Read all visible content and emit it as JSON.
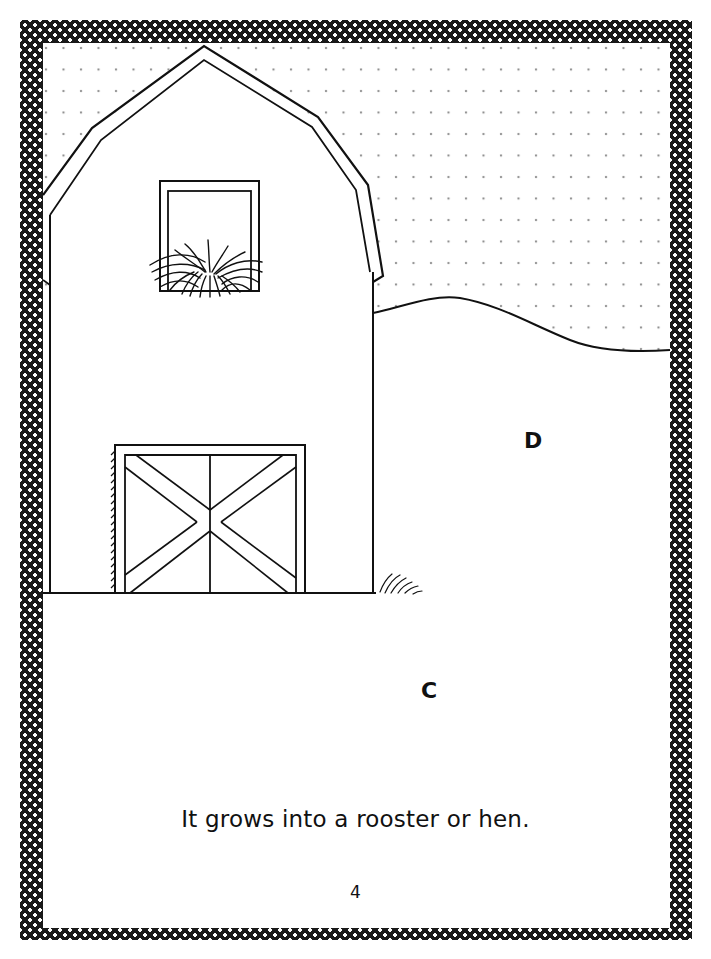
{
  "page": {
    "labels": {
      "d": "D",
      "c": "C"
    },
    "sentence": "It grows into a rooster or hen.",
    "page_number": "4"
  },
  "illustration": {
    "subject": "barn",
    "elements": [
      "dotted-sky",
      "barn-roof",
      "hayloft-window",
      "hay",
      "barn-door",
      "rolling-hill",
      "grass-tuft",
      "ground-line"
    ]
  },
  "colors": {
    "border": "#1a1a1a",
    "ink": "#111111",
    "sky_dots": "#8a8a8a",
    "background": "#ffffff"
  }
}
